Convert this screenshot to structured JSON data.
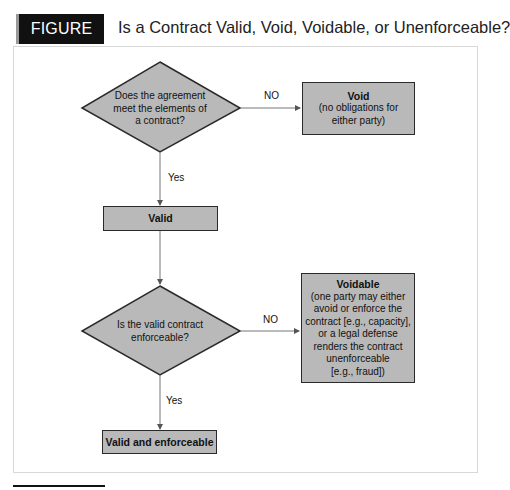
{
  "figure": {
    "label": "FIGURE 6.1",
    "title": "Is a Contract Valid, Void, Voidable, or Unenforceable?"
  },
  "nodes": {
    "q1": {
      "text_lines": [
        "Does the agreement",
        "meet the elements of",
        "a contract?"
      ]
    },
    "void": {
      "title": "Void",
      "lines": [
        "(no obligations for",
        "either party)"
      ]
    },
    "valid": {
      "title": "Valid"
    },
    "q2": {
      "text_lines": [
        "Is the valid contract",
        "enforceable?"
      ]
    },
    "voidable": {
      "title": "Voidable",
      "lines": [
        "(one party may either",
        "avoid or enforce the",
        "contract [e.g., capacity],",
        "or a legal defense",
        "renders the contract",
        "unenforceable",
        "[e.g., fraud])"
      ]
    },
    "valid_enforceable": {
      "title": "Valid and enforceable"
    }
  },
  "edges": {
    "q1_no": "NO",
    "q1_yes": "Yes",
    "q2_no": "NO",
    "q2_yes": "Yes"
  },
  "colors": {
    "node_fill": "#b9b9b9",
    "stroke": "#2a2a2a",
    "label_bg": "#111111"
  }
}
